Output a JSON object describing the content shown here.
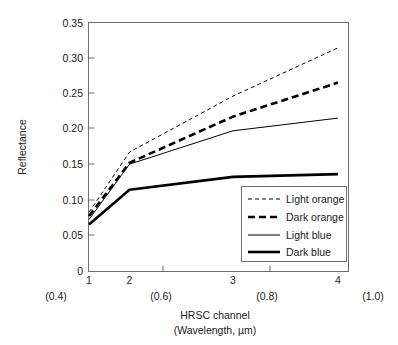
{
  "chart_data": {
    "type": "line",
    "title": "",
    "xlabel": "HRSC channel",
    "xlabel_line2": "(Wavelength, µm)",
    "ylabel": "Reflectance",
    "categories": [
      "1",
      "2",
      "3",
      "4"
    ],
    "x": [
      1,
      2,
      3,
      4
    ],
    "xlim": [
      0.82,
      4.12
    ],
    "ylim": [
      0,
      0.35
    ],
    "grid": false,
    "legend_position": "bottom-right",
    "x_tick_labels": [
      "1",
      "2",
      "3",
      "4"
    ],
    "x_secondary_tick_labels": [
      "(0.4)",
      "(0.6)",
      "(0.8)",
      "(1.0)"
    ],
    "x_secondary_positions": [
      0.82,
      1.9,
      2.95,
      4.12
    ],
    "y_tick_labels": [
      "0",
      "0.05",
      "0.10",
      "0.15",
      "0.20",
      "0.25",
      "0.30",
      "0.35"
    ],
    "y_tick_values": [
      0,
      0.05,
      0.1,
      0.15,
      0.2,
      0.25,
      0.3,
      0.35
    ],
    "series": [
      {
        "name": "Light orange",
        "values": [
          0.083,
          0.168,
          0.247,
          0.315
        ],
        "style": "dashed-thin",
        "color": "#000000",
        "stroke_width": 1.0,
        "dash": "4,3"
      },
      {
        "name": "Dark orange",
        "values": [
          0.078,
          0.153,
          0.218,
          0.266
        ],
        "style": "dashed-thick",
        "color": "#000000",
        "stroke_width": 2.6,
        "dash": "7,4"
      },
      {
        "name": "Light blue",
        "values": [
          0.073,
          0.151,
          0.198,
          0.216
        ],
        "style": "solid-thin",
        "color": "#000000",
        "stroke_width": 1.0,
        "dash": "none"
      },
      {
        "name": "Dark blue",
        "values": [
          0.066,
          0.115,
          0.133,
          0.137
        ],
        "style": "solid-thick",
        "color": "#000000",
        "stroke_width": 2.6,
        "dash": "none"
      }
    ]
  },
  "legend": {
    "items": [
      {
        "label": "Light orange"
      },
      {
        "label": "Dark orange"
      },
      {
        "label": "Light blue"
      },
      {
        "label": "Dark blue"
      }
    ]
  },
  "axes": {
    "y_title": "Reflectance",
    "x_title": "HRSC channel",
    "x_subtitle": "(Wavelength, µm)"
  }
}
